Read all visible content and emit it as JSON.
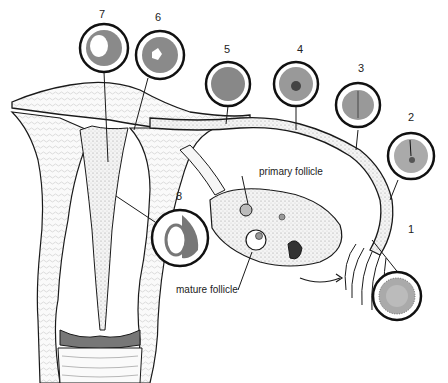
{
  "diagram": {
    "colors": {
      "ink": "#1a1a1a",
      "background": "#ffffff",
      "cell_fill": "#9a9a9a",
      "tissue_fill": "#f2f2f2"
    },
    "stage_labels": [
      {
        "id": "1",
        "label": "1"
      },
      {
        "id": "2",
        "label": "2"
      },
      {
        "id": "3",
        "label": "3"
      },
      {
        "id": "4",
        "label": "4"
      },
      {
        "id": "5",
        "label": "5"
      },
      {
        "id": "6",
        "label": "6"
      },
      {
        "id": "7",
        "label": "7"
      },
      {
        "id": "8",
        "label": "8"
      }
    ],
    "annotations": {
      "primary_follicle": "primary follicle",
      "mature_follicle": "mature follicle"
    }
  }
}
